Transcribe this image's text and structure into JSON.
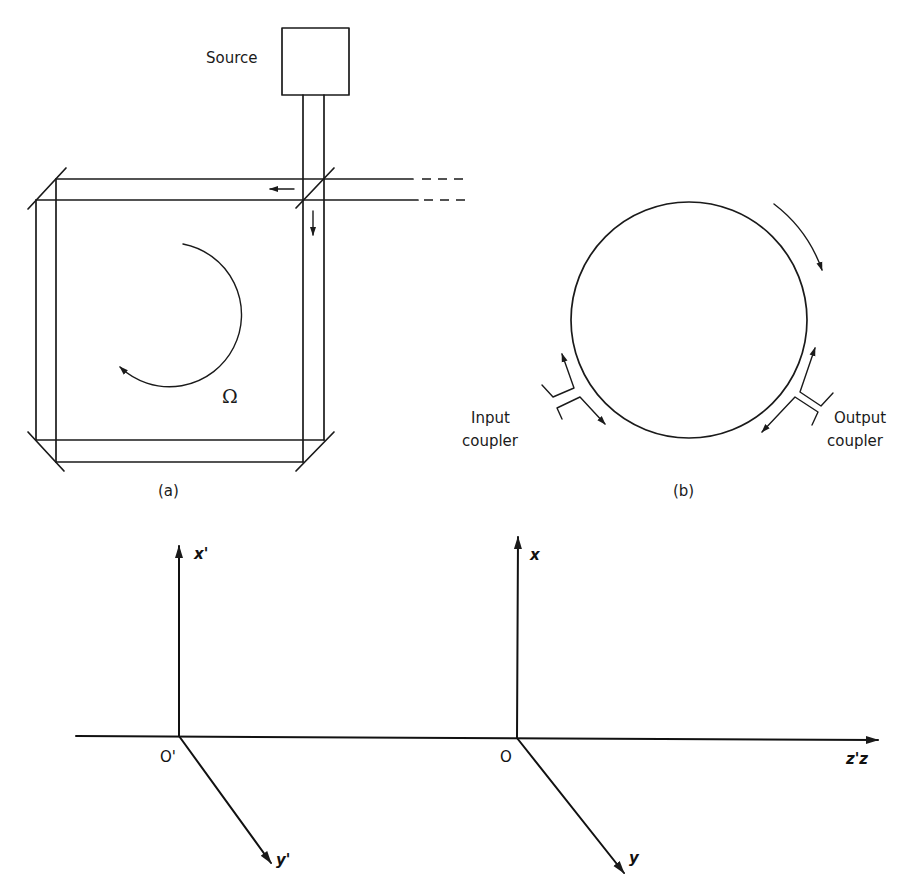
{
  "figure": {
    "panel_a": {
      "caption": "(a)",
      "source_label": "Source",
      "rotation_label": "Ω",
      "description": "Square ring interferometer with beamsplitter, three corner mirrors and rotation rate"
    },
    "panel_b": {
      "caption": "(b)",
      "input_coupler_label_line1": "Input",
      "input_coupler_label_line2": "coupler",
      "output_coupler_label_line1": "Output",
      "output_coupler_label_line2": "coupler",
      "description": "Circular fiber/ring resonator with input and output couplers"
    },
    "coordinate_frames": {
      "primed": {
        "origin_label": "O'",
        "x_label": "x'",
        "y_label": "y'"
      },
      "unprimed": {
        "origin_label": "O",
        "x_label": "x",
        "y_label": "y"
      },
      "z_label": "z'z"
    },
    "colors": {
      "ink": "#1a1a1a",
      "background": "#ffffff"
    }
  }
}
